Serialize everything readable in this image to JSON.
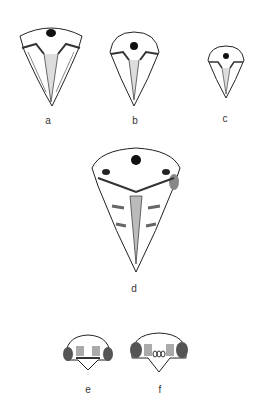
{
  "figure": {
    "panels": [
      {
        "label": "a",
        "subject": "skull-ventral-view-large"
      },
      {
        "label": "b",
        "subject": "skull-ventral-view-medium"
      },
      {
        "label": "c",
        "subject": "skull-ventral-view-small"
      },
      {
        "label": "d",
        "subject": "skull-ventral-view-broad"
      },
      {
        "label": "e",
        "subject": "skull-posterior-view"
      },
      {
        "label": "f",
        "subject": "skull-posterior-view"
      }
    ]
  }
}
